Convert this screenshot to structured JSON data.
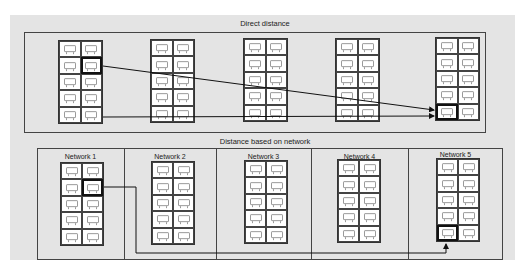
{
  "top_panel": {
    "title": "Direct distance",
    "racks": [
      {
        "id": "rack-1",
        "rows": 5,
        "cols": 2,
        "highlighted": {
          "row": 2,
          "col": 2
        }
      },
      {
        "id": "rack-2",
        "rows": 5,
        "cols": 2
      },
      {
        "id": "rack-3",
        "rows": 5,
        "cols": 2
      },
      {
        "id": "rack-4",
        "rows": 5,
        "cols": 2
      },
      {
        "id": "rack-5",
        "rows": 5,
        "cols": 2,
        "highlighted": {
          "row": 5,
          "col": 1
        }
      }
    ],
    "arrows": [
      {
        "from": "rack-1 row 2 col 2",
        "to": "rack-5 row 5 col 1",
        "style": "direct diagonal"
      },
      {
        "from": "rack-1 row 5 col 2",
        "to": "rack-5 row 5 col 1",
        "style": "direct horizontal"
      }
    ]
  },
  "bottom_panel": {
    "title": "Distance based on network",
    "networks": [
      {
        "label": "Network 1",
        "rows": 5,
        "cols": 2,
        "highlighted": {
          "row": 2,
          "col": 2
        }
      },
      {
        "label": "Network 2",
        "rows": 5,
        "cols": 2
      },
      {
        "label": "Network 3",
        "rows": 5,
        "cols": 2
      },
      {
        "label": "Network 4",
        "rows": 5,
        "cols": 2
      },
      {
        "label": "Network 5",
        "rows": 5,
        "cols": 2,
        "highlighted": {
          "row": 5,
          "col": 1
        }
      }
    ],
    "arrows": [
      {
        "from": "Network 1 row 2 col 2",
        "to": "Network 5 row 5 col 1",
        "style": "routed through network path"
      }
    ]
  },
  "icons": {
    "cell_icon": "server-icon"
  },
  "colors": {
    "background": "#e4e4e4",
    "rack_fill": "#ffffff",
    "line": "#111111",
    "border": "#444444"
  }
}
